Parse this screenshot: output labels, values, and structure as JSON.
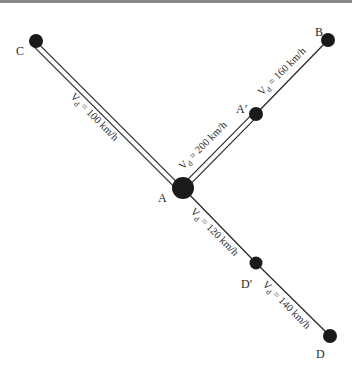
{
  "diagram": {
    "nodes": [
      {
        "id": "A",
        "label": "A",
        "x": 183,
        "y": 188,
        "r": 11
      },
      {
        "id": "A_prime",
        "label": "A′",
        "x": 256,
        "y": 114,
        "r": 7
      },
      {
        "id": "B",
        "label": "B",
        "x": 328,
        "y": 40,
        "r": 7
      },
      {
        "id": "C",
        "label": "C",
        "x": 36,
        "y": 41,
        "r": 7
      },
      {
        "id": "D_prime",
        "label": "D′",
        "x": 256,
        "y": 263,
        "r": 7
      },
      {
        "id": "D",
        "label": "D",
        "x": 330,
        "y": 336,
        "r": 7
      }
    ],
    "edges": [
      {
        "from": "C",
        "to": "A",
        "style": "double",
        "speed_prefix": "V",
        "speed_sub": "d",
        "speed_value": " = 100 km/h"
      },
      {
        "from": "A",
        "to": "A_prime",
        "style": "double",
        "speed_prefix": "V",
        "speed_sub": "d",
        "speed_value": " = 200 km/h"
      },
      {
        "from": "A_prime",
        "to": "B",
        "style": "single",
        "speed_prefix": "V",
        "speed_sub": "d",
        "speed_value": " = 160 km/h"
      },
      {
        "from": "A",
        "to": "D_prime",
        "style": "single",
        "speed_prefix": "V",
        "speed_sub": "d",
        "speed_value": " = 120 km/h"
      },
      {
        "from": "D_prime",
        "to": "D",
        "style": "single",
        "speed_prefix": "V",
        "speed_sub": "d",
        "speed_value": " = 140 km/h"
      }
    ],
    "colors": {
      "line": "#2a2a2a",
      "node": "#1a1a1a",
      "background": "#ffffff"
    }
  }
}
